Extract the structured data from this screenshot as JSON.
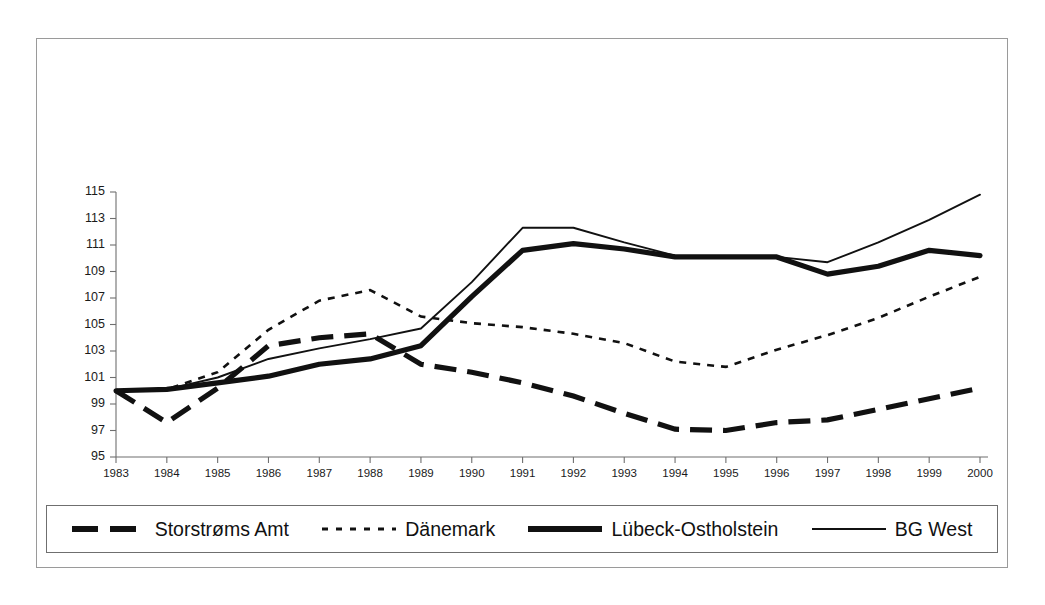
{
  "chart_data": {
    "type": "line",
    "title": "",
    "subtitle": "",
    "xlabel": "",
    "ylabel": "",
    "grid": false,
    "legend_position": "bottom",
    "x": [
      1983,
      1984,
      1985,
      1986,
      1987,
      1988,
      1989,
      1990,
      1991,
      1992,
      1993,
      1994,
      1995,
      1996,
      1997,
      1998,
      1999,
      2000
    ],
    "categories": [
      "1983",
      "1984",
      "1985",
      "1986",
      "1987",
      "1988",
      "1989",
      "1990",
      "1991",
      "1992",
      "1993",
      "1994",
      "1995",
      "1996",
      "1997",
      "1998",
      "1999",
      "2000"
    ],
    "xlim": [
      1983,
      2000
    ],
    "ylim": [
      95,
      115
    ],
    "ytick_labels": [
      "95",
      "97",
      "99",
      "101",
      "103",
      "105",
      "107",
      "109",
      "111",
      "113",
      "115"
    ],
    "yticks": [
      95,
      97,
      99,
      101,
      103,
      105,
      107,
      109,
      111,
      113,
      115
    ],
    "series": [
      {
        "name": "Storstrøms Amt",
        "style": "thick-dashed",
        "color": "#111111",
        "values": [
          100.0,
          97.6,
          100.2,
          103.4,
          104.0,
          104.3,
          102.0,
          101.4,
          100.6,
          99.6,
          98.3,
          97.1,
          97.0,
          97.6,
          97.8,
          98.6,
          99.4,
          100.2
        ]
      },
      {
        "name": "Dänemark",
        "style": "dotted",
        "color": "#111111",
        "values": [
          100.0,
          100.1,
          101.4,
          104.6,
          106.8,
          107.6,
          105.6,
          105.1,
          104.8,
          104.3,
          103.6,
          102.2,
          101.8,
          103.1,
          104.2,
          105.5,
          107.1,
          108.6
        ]
      },
      {
        "name": "Lübeck-Ostholstein",
        "style": "thick-solid",
        "color": "#111111",
        "values": [
          100.0,
          100.1,
          100.6,
          101.1,
          102.0,
          102.4,
          103.4,
          107.1,
          110.6,
          111.1,
          110.7,
          110.1,
          110.1,
          110.1,
          108.8,
          109.4,
          110.6,
          110.2
        ]
      },
      {
        "name": "BG West",
        "style": "thin-solid",
        "color": "#111111",
        "values": [
          100.0,
          100.1,
          101.0,
          102.4,
          103.2,
          103.9,
          104.7,
          108.2,
          112.3,
          112.3,
          111.2,
          110.2,
          110.1,
          110.1,
          109.7,
          111.2,
          112.9,
          114.8
        ]
      }
    ]
  },
  "axis": {
    "y_ticks": [
      "115",
      "113",
      "111",
      "109",
      "107",
      "105",
      "103",
      "101",
      "99",
      "97",
      "95"
    ],
    "x_ticks": [
      "1983",
      "1984",
      "1985",
      "1986",
      "1987",
      "1988",
      "1989",
      "1990",
      "1991",
      "1992",
      "1993",
      "1994",
      "1995",
      "1996",
      "1997",
      "1998",
      "1999",
      "2000"
    ]
  },
  "legend": {
    "items": [
      {
        "label": "Storstrøms Amt",
        "style": "thick-dashed"
      },
      {
        "label": "Dänemark",
        "style": "dotted"
      },
      {
        "label": "Lübeck-Ostholstein",
        "style": "thick-solid"
      },
      {
        "label": "BG West",
        "style": "thin-solid"
      }
    ]
  }
}
